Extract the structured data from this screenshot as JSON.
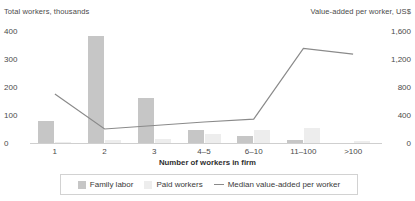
{
  "chart_data": {
    "type": "bar",
    "title": "",
    "categories": [
      "1",
      "2",
      "3",
      "4–5",
      "6–10",
      "11–100",
      ">100"
    ],
    "xlabel": "Number of workers in firm",
    "left_axis": {
      "label": "Total workers, thousands",
      "ticks": [
        "400",
        "300",
        "200",
        "100",
        "0"
      ],
      "tick_values": [
        400,
        300,
        200,
        100,
        0
      ],
      "ylim": [
        0,
        400
      ]
    },
    "right_axis": {
      "label": "Value-added per worker, US$",
      "ticks": [
        "1,600",
        "1,200",
        "800",
        "400",
        "0"
      ],
      "tick_values": [
        1600,
        1200,
        800,
        400,
        0
      ],
      "ylim": [
        0,
        1600
      ]
    },
    "series": [
      {
        "name": "Family labor",
        "type": "bar",
        "axis": "left",
        "color": "#c6c6c6",
        "values": [
          80,
          383,
          160,
          45,
          25,
          12,
          0
        ]
      },
      {
        "name": "Paid workers",
        "type": "bar",
        "axis": "left",
        "color": "#ededed",
        "values": [
          4,
          12,
          14,
          33,
          48,
          52,
          6
        ]
      },
      {
        "name": "Median value-added per worker",
        "type": "line",
        "axis": "right",
        "color": "#8a8a8a",
        "values": [
          700,
          200,
          250,
          300,
          340,
          1350,
          1270
        ]
      }
    ],
    "grid": false,
    "legend_position": "bottom"
  },
  "legend": {
    "family_label": "Family labor",
    "paid_label": "Paid workers",
    "line_label": "Median value-added per worker"
  }
}
